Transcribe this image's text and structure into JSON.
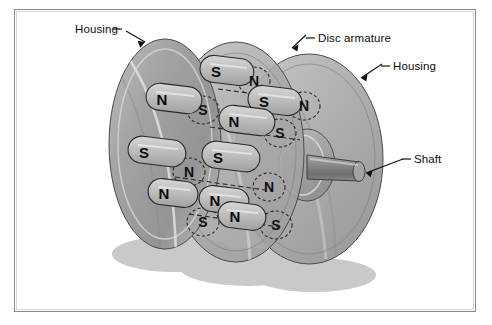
{
  "figure": {
    "type": "technical-illustration",
    "background_color": "#ffffff",
    "border_color": "#8a8a8a"
  },
  "labels": [
    {
      "id": "housing-left",
      "text": "Housing",
      "x": 61,
      "y": 21,
      "leader": "line-arrow-down-right"
    },
    {
      "id": "disc-armature",
      "text": "Disc armature",
      "x": 304,
      "y": 31,
      "leader": "line-arrow-down-left"
    },
    {
      "id": "housing-right",
      "text": "Housing",
      "x": 379,
      "y": 59,
      "leader": "line-arrow-down-left"
    },
    {
      "id": "shaft",
      "text": "Shaft",
      "x": 400,
      "y": 152,
      "leader": "line-arrow-down-left"
    }
  ],
  "components": {
    "housing_left": {
      "name": "Left housing disc",
      "fill": "#9a9a9a"
    },
    "disc_armature": {
      "name": "Disc armature",
      "fill": "#a8a8a8"
    },
    "housing_right": {
      "name": "Right housing disc",
      "fill": "#a5a5a5"
    },
    "shaft": {
      "name": "Shaft",
      "fill": "#8e8e8e"
    },
    "hub": {
      "name": "Shaft hub boss",
      "fill": "#a0a0a0"
    },
    "shadow": {
      "name": "Cast shadow",
      "fill": "#c9c9c9"
    }
  },
  "magnets": {
    "style_solid": {
      "description": "Front-face magnets (solid outline)"
    },
    "style_dashed": {
      "description": "Rear / hidden magnets (dashed outline)"
    },
    "poles_front": [
      {
        "pole": "S",
        "x": 206,
        "y": 62
      },
      {
        "pole": "N",
        "x": 153,
        "y": 89
      },
      {
        "pole": "S",
        "x": 253,
        "y": 91
      },
      {
        "pole": "N",
        "x": 224,
        "y": 111
      },
      {
        "pole": "S",
        "x": 135,
        "y": 142
      },
      {
        "pole": "S",
        "x": 208,
        "y": 147
      },
      {
        "pole": "N",
        "x": 203,
        "y": 191
      },
      {
        "pole": "N",
        "x": 154,
        "y": 184
      },
      {
        "pole": "N",
        "x": 222,
        "y": 207
      }
    ],
    "poles_hidden": [
      {
        "pole": "N",
        "x": 240,
        "y": 72
      },
      {
        "pole": "S",
        "x": 189,
        "y": 101
      },
      {
        "pole": "N",
        "x": 290,
        "y": 97
      },
      {
        "pole": "S",
        "x": 266,
        "y": 124
      },
      {
        "pole": "N",
        "x": 175,
        "y": 163
      },
      {
        "pole": "N",
        "x": 255,
        "y": 178
      },
      {
        "pole": "S",
        "x": 189,
        "y": 213
      },
      {
        "pole": "S",
        "x": 262,
        "y": 216
      }
    ]
  }
}
